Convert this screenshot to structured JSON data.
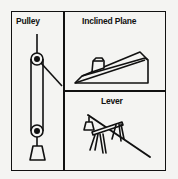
{
  "diagram": {
    "panels": [
      {
        "id": "pulley",
        "title": "Pulley"
      },
      {
        "id": "inclined-plane",
        "title": "Inclined Plane"
      },
      {
        "id": "lever",
        "title": "Lever"
      }
    ],
    "colors": {
      "line": "#111111",
      "background": "#f4f4f2"
    }
  }
}
